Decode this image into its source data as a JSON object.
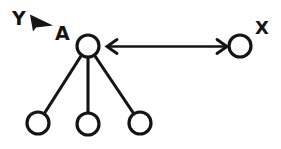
{
  "diagram": {
    "background_color": "#ffffff",
    "stroke_color": "#141414",
    "labels": {
      "y": "Y",
      "a": "A",
      "x": "X"
    },
    "nodes": [
      {
        "id": "a",
        "label": "A",
        "cx": 88,
        "cy": 46,
        "r": 11
      },
      {
        "id": "x",
        "label": "X",
        "cx": 240,
        "cy": 46,
        "r": 11
      },
      {
        "id": "c1",
        "label": "",
        "cx": 38,
        "cy": 123,
        "r": 11
      },
      {
        "id": "c2",
        "label": "",
        "cx": 88,
        "cy": 124,
        "r": 11
      },
      {
        "id": "c3",
        "label": "",
        "cx": 140,
        "cy": 123,
        "r": 11
      }
    ],
    "edges": [
      {
        "from": "a",
        "to": "c1",
        "style": "plain-line"
      },
      {
        "from": "a",
        "to": "c2",
        "style": "plain-line"
      },
      {
        "from": "a",
        "to": "c3",
        "style": "plain-line"
      },
      {
        "from": "a",
        "to": "x",
        "style": "double-headed-arrow"
      }
    ],
    "annotations": [
      {
        "name": "y-pointer",
        "label": "Y",
        "points_to": "A",
        "style": "solid-dart"
      }
    ]
  }
}
